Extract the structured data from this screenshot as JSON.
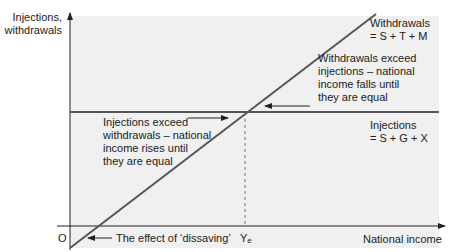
{
  "diagram": {
    "type": "economics-equilibrium",
    "y_axis_label_line1": "Injections,",
    "y_axis_label_line2": "withdrawals",
    "x_axis_label": "National income",
    "origin_label": "O",
    "equilibrium_label_main": "Y",
    "equilibrium_label_sub": "e",
    "withdrawals_line": {
      "label_line1": "Withdrawals",
      "label_line2": "= S + T + M"
    },
    "injections_line": {
      "label_line1": "Injections",
      "label_line2": "= S + G + X"
    },
    "annotations": {
      "withdrawals_exceed": [
        "Withdrawals exceed",
        "injections – national",
        "income falls until",
        "they are equal"
      ],
      "injections_exceed": [
        "Injections exceed",
        "withdrawals – national",
        "income rises until",
        "they are equal"
      ],
      "dissaving": "The effect of ‘dissaving’"
    },
    "colors": {
      "panel": "#f0f0f0",
      "lines": "#555555",
      "axes": "#222222",
      "text": "#222222"
    }
  }
}
